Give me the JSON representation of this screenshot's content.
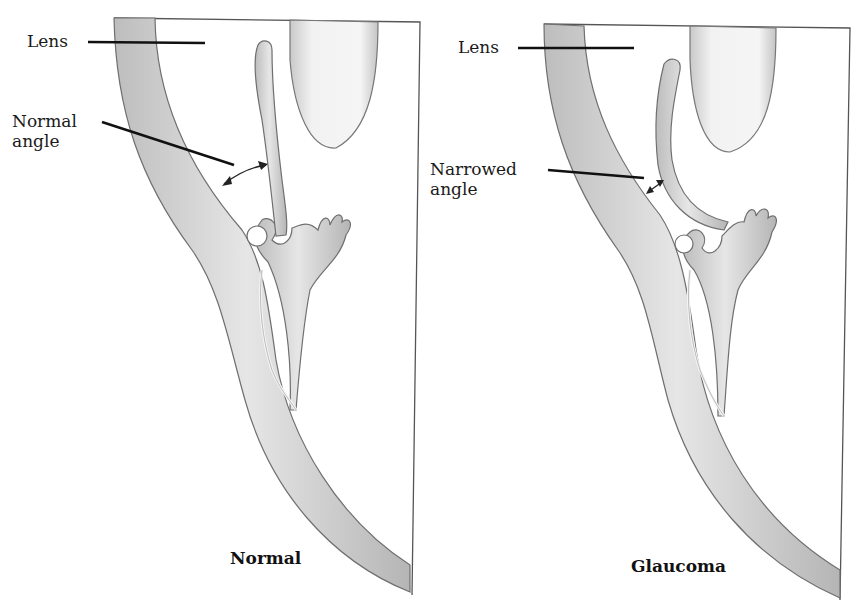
{
  "figure": {
    "panels": [
      {
        "id": "normal",
        "caption": "Normal",
        "labels": {
          "lens": "Lens",
          "angle_line1": "Normal",
          "angle_line2": "angle"
        }
      },
      {
        "id": "glaucoma",
        "caption": "Glaucoma",
        "labels": {
          "lens": "Lens",
          "angle_line1": "Narrowed",
          "angle_line2": "angle"
        }
      }
    ],
    "colors": {
      "background": "#ffffff",
      "tissue_fill": "#d9d9d9",
      "tissue_edge": "#6f6f6f",
      "leader_line": "#111111",
      "frame": "#555555"
    }
  }
}
